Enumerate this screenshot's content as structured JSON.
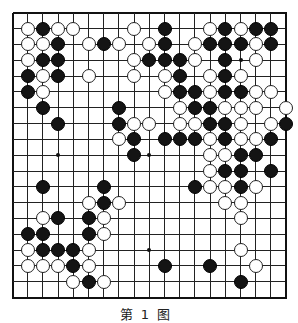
{
  "diagram": {
    "type": "go-board",
    "size": 19,
    "caption": "第1图",
    "geometry": {
      "x0": 12.5,
      "y0": 12.7,
      "dx": 15.2,
      "dy": 15.83,
      "stone_size": 14
    },
    "colors": {
      "black": "#141414",
      "white": "#ffffff",
      "line": "#222222"
    },
    "star_points": [
      [
        3,
        3
      ],
      [
        9,
        3
      ],
      [
        15,
        3
      ],
      [
        3,
        9
      ],
      [
        9,
        9
      ],
      [
        15,
        9
      ],
      [
        3,
        15
      ],
      [
        9,
        15
      ],
      [
        15,
        15
      ]
    ],
    "stones": [
      {
        "c": 1,
        "r": 1,
        "color": "W"
      },
      {
        "c": 2,
        "r": 1,
        "color": "B"
      },
      {
        "c": 3,
        "r": 1,
        "color": "W"
      },
      {
        "c": 4,
        "r": 1,
        "color": "W"
      },
      {
        "c": 8,
        "r": 1,
        "color": "W"
      },
      {
        "c": 10,
        "r": 1,
        "color": "B"
      },
      {
        "c": 13,
        "r": 1,
        "color": "W"
      },
      {
        "c": 14,
        "r": 1,
        "color": "B"
      },
      {
        "c": 15,
        "r": 1,
        "color": "W"
      },
      {
        "c": 16,
        "r": 1,
        "color": "B"
      },
      {
        "c": 17,
        "r": 1,
        "color": "B"
      },
      {
        "c": 1,
        "r": 2,
        "color": "W"
      },
      {
        "c": 2,
        "r": 2,
        "color": "W"
      },
      {
        "c": 3,
        "r": 2,
        "color": "B"
      },
      {
        "c": 5,
        "r": 2,
        "color": "W"
      },
      {
        "c": 6,
        "r": 2,
        "color": "B"
      },
      {
        "c": 7,
        "r": 2,
        "color": "W"
      },
      {
        "c": 9,
        "r": 2,
        "color": "W"
      },
      {
        "c": 10,
        "r": 2,
        "color": "B"
      },
      {
        "c": 12,
        "r": 2,
        "color": "W"
      },
      {
        "c": 13,
        "r": 2,
        "color": "B"
      },
      {
        "c": 14,
        "r": 2,
        "color": "B"
      },
      {
        "c": 15,
        "r": 2,
        "color": "B"
      },
      {
        "c": 16,
        "r": 2,
        "color": "W"
      },
      {
        "c": 17,
        "r": 2,
        "color": "B"
      },
      {
        "c": 1,
        "r": 3,
        "color": "W"
      },
      {
        "c": 2,
        "r": 3,
        "color": "B"
      },
      {
        "c": 3,
        "r": 3,
        "color": "B"
      },
      {
        "c": 8,
        "r": 3,
        "color": "W"
      },
      {
        "c": 9,
        "r": 3,
        "color": "B"
      },
      {
        "c": 10,
        "r": 3,
        "color": "B"
      },
      {
        "c": 11,
        "r": 3,
        "color": "B"
      },
      {
        "c": 12,
        "r": 3,
        "color": "W"
      },
      {
        "c": 14,
        "r": 3,
        "color": "B"
      },
      {
        "c": 16,
        "r": 3,
        "color": "W"
      },
      {
        "c": 1,
        "r": 4,
        "color": "B"
      },
      {
        "c": 2,
        "r": 4,
        "color": "W"
      },
      {
        "c": 3,
        "r": 4,
        "color": "B"
      },
      {
        "c": 5,
        "r": 4,
        "color": "W"
      },
      {
        "c": 8,
        "r": 4,
        "color": "W"
      },
      {
        "c": 10,
        "r": 4,
        "color": "W"
      },
      {
        "c": 11,
        "r": 4,
        "color": "B"
      },
      {
        "c": 13,
        "r": 4,
        "color": "W"
      },
      {
        "c": 14,
        "r": 4,
        "color": "B"
      },
      {
        "c": 15,
        "r": 4,
        "color": "W"
      },
      {
        "c": 1,
        "r": 5,
        "color": "B"
      },
      {
        "c": 2,
        "r": 5,
        "color": "W"
      },
      {
        "c": 10,
        "r": 5,
        "color": "W"
      },
      {
        "c": 11,
        "r": 5,
        "color": "B"
      },
      {
        "c": 12,
        "r": 5,
        "color": "B"
      },
      {
        "c": 13,
        "r": 5,
        "color": "W"
      },
      {
        "c": 14,
        "r": 5,
        "color": "B"
      },
      {
        "c": 15,
        "r": 5,
        "color": "B"
      },
      {
        "c": 16,
        "r": 5,
        "color": "W"
      },
      {
        "c": 17,
        "r": 5,
        "color": "W"
      },
      {
        "c": 2,
        "r": 6,
        "color": "B"
      },
      {
        "c": 7,
        "r": 6,
        "color": "B"
      },
      {
        "c": 11,
        "r": 6,
        "color": "W"
      },
      {
        "c": 12,
        "r": 6,
        "color": "B"
      },
      {
        "c": 13,
        "r": 6,
        "color": "B"
      },
      {
        "c": 14,
        "r": 6,
        "color": "W"
      },
      {
        "c": 15,
        "r": 6,
        "color": "W"
      },
      {
        "c": 16,
        "r": 6,
        "color": "W"
      },
      {
        "c": 18,
        "r": 6,
        "color": "W"
      },
      {
        "c": 3,
        "r": 7,
        "color": "B"
      },
      {
        "c": 7,
        "r": 7,
        "color": "B"
      },
      {
        "c": 8,
        "r": 7,
        "color": "W"
      },
      {
        "c": 9,
        "r": 7,
        "color": "W"
      },
      {
        "c": 11,
        "r": 7,
        "color": "W"
      },
      {
        "c": 12,
        "r": 7,
        "color": "W"
      },
      {
        "c": 13,
        "r": 7,
        "color": "B"
      },
      {
        "c": 14,
        "r": 7,
        "color": "B"
      },
      {
        "c": 15,
        "r": 7,
        "color": "W"
      },
      {
        "c": 17,
        "r": 7,
        "color": "W"
      },
      {
        "c": 18,
        "r": 7,
        "color": "B"
      },
      {
        "c": 7,
        "r": 8,
        "color": "W"
      },
      {
        "c": 8,
        "r": 8,
        "color": "B"
      },
      {
        "c": 10,
        "r": 8,
        "color": "B"
      },
      {
        "c": 11,
        "r": 8,
        "color": "B"
      },
      {
        "c": 12,
        "r": 8,
        "color": "B"
      },
      {
        "c": 13,
        "r": 8,
        "color": "W"
      },
      {
        "c": 14,
        "r": 8,
        "color": "B"
      },
      {
        "c": 15,
        "r": 8,
        "color": "W"
      },
      {
        "c": 16,
        "r": 8,
        "color": "W"
      },
      {
        "c": 17,
        "r": 8,
        "color": "B"
      },
      {
        "c": 8,
        "r": 9,
        "color": "B"
      },
      {
        "c": 13,
        "r": 9,
        "color": "W"
      },
      {
        "c": 14,
        "r": 9,
        "color": "W"
      },
      {
        "c": 15,
        "r": 9,
        "color": "B"
      },
      {
        "c": 16,
        "r": 9,
        "color": "B"
      },
      {
        "c": 13,
        "r": 10,
        "color": "W"
      },
      {
        "c": 14,
        "r": 10,
        "color": "B"
      },
      {
        "c": 15,
        "r": 10,
        "color": "B"
      },
      {
        "c": 17,
        "r": 10,
        "color": "B"
      },
      {
        "c": 2,
        "r": 11,
        "color": "B"
      },
      {
        "c": 6,
        "r": 11,
        "color": "B"
      },
      {
        "c": 12,
        "r": 11,
        "color": "B"
      },
      {
        "c": 13,
        "r": 11,
        "color": "W"
      },
      {
        "c": 14,
        "r": 11,
        "color": "W"
      },
      {
        "c": 15,
        "r": 11,
        "color": "B"
      },
      {
        "c": 16,
        "r": 11,
        "color": "W"
      },
      {
        "c": 5,
        "r": 12,
        "color": "W"
      },
      {
        "c": 6,
        "r": 12,
        "color": "B"
      },
      {
        "c": 7,
        "r": 12,
        "color": "W"
      },
      {
        "c": 14,
        "r": 12,
        "color": "W"
      },
      {
        "c": 15,
        "r": 12,
        "color": "W"
      },
      {
        "c": 2,
        "r": 13,
        "color": "W"
      },
      {
        "c": 3,
        "r": 13,
        "color": "B"
      },
      {
        "c": 5,
        "r": 13,
        "color": "B"
      },
      {
        "c": 6,
        "r": 13,
        "color": "W"
      },
      {
        "c": 15,
        "r": 13,
        "color": "W"
      },
      {
        "c": 1,
        "r": 14,
        "color": "B"
      },
      {
        "c": 2,
        "r": 14,
        "color": "B"
      },
      {
        "c": 5,
        "r": 14,
        "color": "B"
      },
      {
        "c": 6,
        "r": 14,
        "color": "W"
      },
      {
        "c": 1,
        "r": 15,
        "color": "W"
      },
      {
        "c": 2,
        "r": 15,
        "color": "B"
      },
      {
        "c": 3,
        "r": 15,
        "color": "B"
      },
      {
        "c": 4,
        "r": 15,
        "color": "B"
      },
      {
        "c": 5,
        "r": 15,
        "color": "W"
      },
      {
        "c": 15,
        "r": 15,
        "color": "W"
      },
      {
        "c": 1,
        "r": 16,
        "color": "W"
      },
      {
        "c": 2,
        "r": 16,
        "color": "W"
      },
      {
        "c": 3,
        "r": 16,
        "color": "W"
      },
      {
        "c": 4,
        "r": 16,
        "color": "B"
      },
      {
        "c": 5,
        "r": 16,
        "color": "W"
      },
      {
        "c": 10,
        "r": 16,
        "color": "B"
      },
      {
        "c": 13,
        "r": 16,
        "color": "B"
      },
      {
        "c": 16,
        "r": 16,
        "color": "W"
      },
      {
        "c": 4,
        "r": 17,
        "color": "W"
      },
      {
        "c": 5,
        "r": 17,
        "color": "B"
      },
      {
        "c": 6,
        "r": 17,
        "color": "W"
      },
      {
        "c": 15,
        "r": 17,
        "color": "B"
      }
    ]
  }
}
